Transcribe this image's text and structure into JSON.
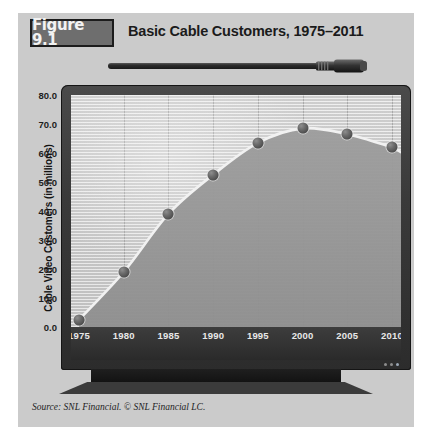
{
  "figure": {
    "label": "Figure 9.1",
    "title": "Basic Cable Customers, 1975–2011",
    "source": "Source: SNL Financial. © SNL Financial LC."
  },
  "colors": {
    "panel_bg": "#cbcbcb",
    "label_box_bg": "#6e6e6e",
    "bezel": "#3a3a3a",
    "plot_bg": "#d6d6d6",
    "area_fill": "#9a9a9a",
    "line": "#f0f0f0",
    "marker": "#555555",
    "axis_strip": "#333333"
  },
  "icons": {
    "coax_cable": "coaxial-cable-icon",
    "monitor": "crt-monitor-icon",
    "power_led": "power-led-icon"
  },
  "chart_data": {
    "type": "area",
    "title": "Basic Cable Customers, 1975–2011",
    "xlabel": "",
    "ylabel": "Cable Video Customers (in millions)",
    "x": [
      1975,
      1980,
      1985,
      1990,
      1995,
      2000,
      2005,
      2010
    ],
    "values": [
      2.5,
      19.0,
      39.0,
      52.5,
      63.5,
      68.5,
      66.5,
      62.0
    ],
    "categories": [
      "1975",
      "1980",
      "1985",
      "1990",
      "1995",
      "2000",
      "2005",
      "2010"
    ],
    "ylim": [
      0.0,
      80.0
    ],
    "xlim": [
      1975,
      2011
    ],
    "ytick_labels": [
      "80.0",
      "70.0",
      "60.0",
      "50.0",
      "40.0",
      "30.0",
      "20.0",
      "10.0",
      "0.0"
    ],
    "ytick_values": [
      80.0,
      70.0,
      60.0,
      50.0,
      40.0,
      30.0,
      20.0,
      10.0,
      0.0
    ],
    "xtick_labels": [
      "1975",
      "1980",
      "1985",
      "1990",
      "1995",
      "2000",
      "2005",
      "2010"
    ],
    "grid": "vertical-gridlines-and-horizontal-scanlines",
    "legend": "none",
    "series": [
      {
        "name": "Cable Video Customers (in millions)",
        "values": [
          2.5,
          19.0,
          39.0,
          52.5,
          63.5,
          68.5,
          66.5,
          62.0
        ]
      }
    ]
  }
}
